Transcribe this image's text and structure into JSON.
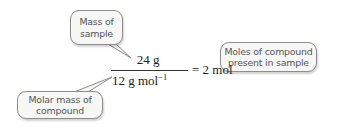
{
  "diagram": {
    "equation": {
      "numerator": "24 g",
      "denominator_base": "12 g mol",
      "denominator_exponent": "−1",
      "equals": "=",
      "result": "2 mol"
    },
    "callouts": {
      "mass_of_sample": {
        "line1": "Mass of",
        "line2": "sample"
      },
      "molar_mass": {
        "line1": "Molar mass of",
        "line2": "compound"
      },
      "moles": {
        "line1": "Moles of compound",
        "line2": "present in sample"
      }
    },
    "colors": {
      "bubble_fill": "#f7f7f5",
      "bubble_border": "#8d8d8d",
      "bubble_text": "#555555",
      "math_text": "#222222"
    }
  }
}
